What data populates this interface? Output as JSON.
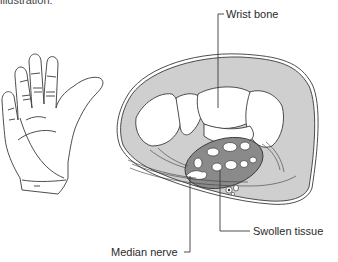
{
  "figure": {
    "partial_heading": "illustration:",
    "colors": {
      "line": "#3a3a3a",
      "tissue_gray": "#cfcfcf",
      "swollen_dark": "#8a8a8a",
      "bone_white": "#ffffff",
      "background": "#ffffff"
    },
    "labels": {
      "wrist_bone": "Wrist bone",
      "swollen_tissue": "Swollen tissue",
      "median_nerve": "Median nerve"
    }
  }
}
